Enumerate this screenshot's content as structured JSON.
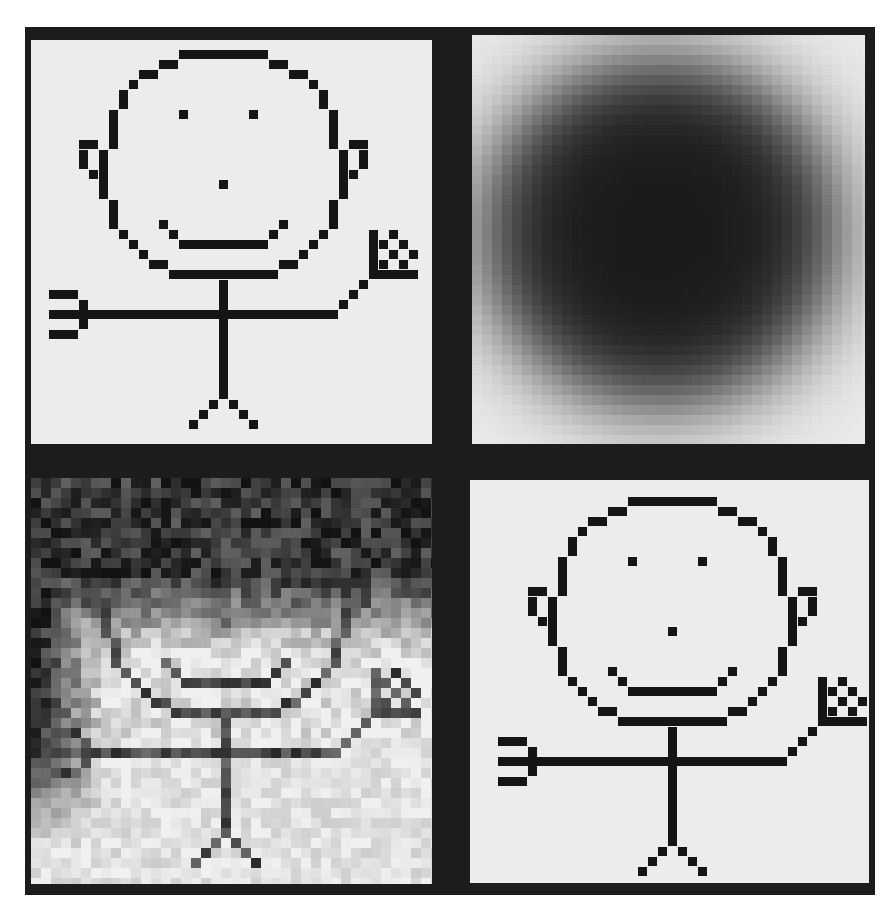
{
  "figure": {
    "layout": "2x2 grid of pixel-art panels on dark frame",
    "colors": {
      "frame": "#1c1c1c",
      "paper": "#ececec",
      "ink": "#151515"
    },
    "panels": [
      {
        "id": "original",
        "left": 31,
        "top": 40,
        "width": 401,
        "height": 404,
        "fig_x": 0,
        "fig_y": 0
      },
      {
        "id": "blurred",
        "left": 472,
        "top": 35,
        "width": 393,
        "height": 409
      },
      {
        "id": "noisy",
        "left": 31,
        "top": 478,
        "width": 401,
        "height": 406,
        "fig_x": 2,
        "fig_y": 439
      },
      {
        "id": "restored",
        "left": 470,
        "top": 480,
        "width": 399,
        "height": 403,
        "fig_x": 449,
        "fig_y": 447
      }
    ],
    "grid": {
      "cell": 10,
      "origin_x": 29,
      "origin_y": 50
    },
    "stick_figure_cells": [
      [
        15,
        0,
        9,
        1
      ],
      [
        13,
        1,
        2,
        1
      ],
      [
        24,
        1,
        2,
        1
      ],
      [
        11,
        2,
        2,
        1
      ],
      [
        26,
        2,
        2,
        1
      ],
      [
        10,
        3,
        1,
        1
      ],
      [
        28,
        3,
        1,
        1
      ],
      [
        9,
        4,
        1,
        2
      ],
      [
        29,
        4,
        1,
        2
      ],
      [
        8,
        6,
        1,
        4
      ],
      [
        30,
        6,
        1,
        4
      ],
      [
        15,
        6,
        1,
        1
      ],
      [
        22,
        6,
        1,
        1
      ],
      [
        5,
        9,
        2,
        1
      ],
      [
        5,
        10,
        1,
        2
      ],
      [
        6,
        12,
        1,
        1
      ],
      [
        7,
        10,
        1,
        5
      ],
      [
        32,
        9,
        2,
        1
      ],
      [
        33,
        10,
        1,
        2
      ],
      [
        32,
        12,
        1,
        1
      ],
      [
        31,
        10,
        1,
        5
      ],
      [
        8,
        15,
        1,
        3
      ],
      [
        30,
        15,
        1,
        3
      ],
      [
        19,
        13,
        1,
        1
      ],
      [
        13,
        17,
        1,
        1
      ],
      [
        25,
        17,
        1,
        1
      ],
      [
        14,
        18,
        1,
        1
      ],
      [
        24,
        18,
        1,
        1
      ],
      [
        15,
        19,
        9,
        1
      ],
      [
        9,
        18,
        1,
        1
      ],
      [
        29,
        18,
        1,
        1
      ],
      [
        10,
        19,
        1,
        1
      ],
      [
        28,
        19,
        1,
        1
      ],
      [
        11,
        20,
        1,
        1
      ],
      [
        27,
        20,
        1,
        1
      ],
      [
        12,
        21,
        2,
        1
      ],
      [
        25,
        21,
        2,
        1
      ],
      [
        14,
        22,
        11,
        1
      ],
      [
        19,
        23,
        1,
        12
      ],
      [
        2,
        26,
        29,
        1
      ],
      [
        2,
        24,
        3,
        1
      ],
      [
        5,
        25,
        1,
        3
      ],
      [
        2,
        28,
        3,
        1
      ],
      [
        31,
        25,
        1,
        1
      ],
      [
        32,
        24,
        1,
        1
      ],
      [
        33,
        23,
        1,
        1
      ],
      [
        34,
        18,
        1,
        5
      ],
      [
        34,
        22,
        5,
        1
      ],
      [
        36,
        18,
        1,
        1
      ],
      [
        35,
        19,
        1,
        1
      ],
      [
        37,
        19,
        1,
        1
      ],
      [
        36,
        20,
        1,
        1
      ],
      [
        38,
        20,
        1,
        1
      ],
      [
        35,
        21,
        1,
        1
      ],
      [
        37,
        21,
        1,
        1
      ],
      [
        18,
        35,
        1,
        1
      ],
      [
        20,
        35,
        1,
        1
      ],
      [
        17,
        36,
        1,
        1
      ],
      [
        21,
        36,
        1,
        1
      ],
      [
        16,
        37,
        1,
        1
      ],
      [
        22,
        37,
        1,
        1
      ]
    ],
    "blur": {
      "center_x": 660,
      "center_y": 232,
      "radius_x": 175,
      "radius_y": 172,
      "core_color": "#1a1a1a"
    },
    "noise": {
      "seed": 7,
      "cols": 40,
      "rows": 40,
      "dark_top_until_row": 17,
      "dark_left_until_col": 7
    }
  }
}
